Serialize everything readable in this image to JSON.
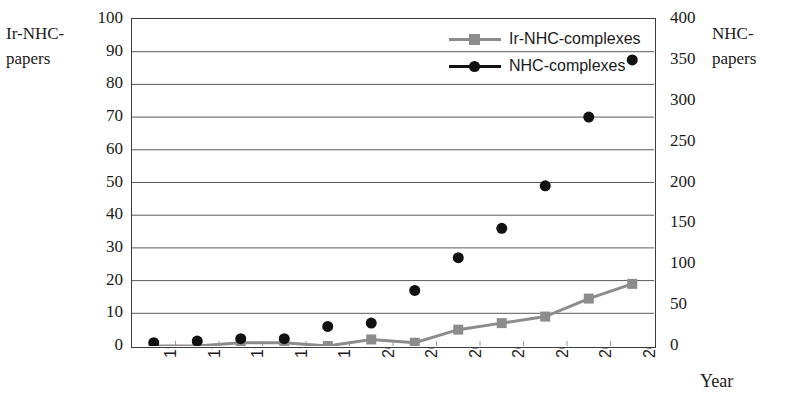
{
  "chart_data": {
    "type": "line",
    "title": "",
    "xlabel": "Year",
    "categories": [
      "1995",
      "1996",
      "1997",
      "1998",
      "1999",
      "2000",
      "2001",
      "2002",
      "2003",
      "2004",
      "2005",
      "2006"
    ],
    "series": [
      {
        "name": "Ir-NHC-complexes",
        "axis": "left",
        "marker": "square",
        "color": "#8c8c8c",
        "values": [
          0,
          0,
          1,
          1,
          0,
          2,
          1,
          5,
          7,
          9,
          14.5,
          19
        ]
      },
      {
        "name": "NHC-complexes",
        "axis": "right",
        "marker": "circle",
        "color": "#111111",
        "values": [
          4,
          6,
          9,
          9,
          24,
          28,
          68,
          108,
          144,
          196,
          280,
          350
        ]
      }
    ],
    "left_axis": {
      "label": "Ir-NHC-papers",
      "ylim": [
        0,
        100
      ],
      "ticks": [
        0,
        10,
        20,
        30,
        40,
        50,
        60,
        70,
        80,
        90,
        100
      ],
      "tick_labels": [
        "0",
        "10",
        "20",
        "30",
        "40",
        "50",
        "60",
        "70",
        "80",
        "90",
        "100"
      ]
    },
    "right_axis": {
      "label": "NHC-papers",
      "ylim": [
        0,
        400
      ],
      "ticks": [
        0,
        50,
        100,
        150,
        200,
        250,
        300,
        350,
        400
      ],
      "tick_labels": [
        "0",
        "50",
        "100",
        "150",
        "200",
        "250",
        "300",
        "350",
        "400"
      ]
    },
    "grid": "horizontal",
    "legend_position": "top-center",
    "legend": [
      {
        "label": "Ir-NHC-complexes",
        "color": "#8c8c8c",
        "marker": "square"
      },
      {
        "label": "NHC-complexes",
        "color": "#111111",
        "marker": "circle"
      }
    ]
  }
}
